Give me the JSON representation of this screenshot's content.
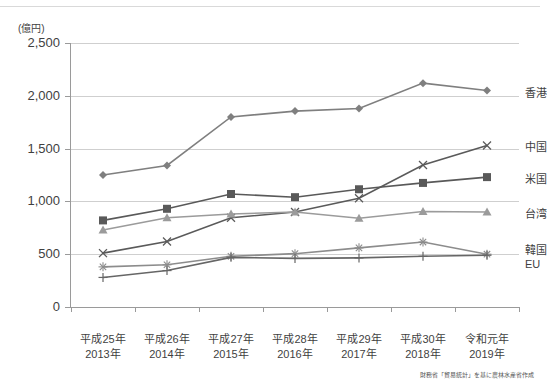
{
  "chart_data": {
    "type": "line",
    "title": "",
    "unit_label": "(億円)",
    "xlabel": "",
    "ylabel": "",
    "ylim": [
      0,
      2500
    ],
    "yticks": [
      "0",
      "500",
      "1,000",
      "1,500",
      "2,000",
      "2,500"
    ],
    "ytick_values": [
      0,
      500,
      1000,
      1500,
      2000,
      2500
    ],
    "grid": true,
    "legend_position": "right",
    "categories": [
      "2013",
      "2014",
      "2015",
      "2016",
      "2017",
      "2018",
      "2019"
    ],
    "category_labels": [
      {
        "era": "平成25年",
        "year": "2013年"
      },
      {
        "era": "平成26年",
        "year": "2014年"
      },
      {
        "era": "平成27年",
        "year": "2015年"
      },
      {
        "era": "平成28年",
        "year": "2016年"
      },
      {
        "era": "平成29年",
        "year": "2017年"
      },
      {
        "era": "平成30年",
        "year": "2018年"
      },
      {
        "era": "令和元年",
        "year": "2019年"
      }
    ],
    "series": [
      {
        "name": "香港",
        "marker": "diamond",
        "color": "#7f7f7f",
        "values": [
          1250,
          1340,
          1800,
          1855,
          1880,
          2120,
          2050
        ]
      },
      {
        "name": "中国",
        "marker": "x",
        "color": "#5a5a5a",
        "values": [
          510,
          620,
          845,
          900,
          1030,
          1345,
          1530
        ]
      },
      {
        "name": "米国",
        "marker": "square",
        "color": "#595959",
        "values": [
          820,
          930,
          1070,
          1040,
          1115,
          1175,
          1230
        ]
      },
      {
        "name": "台湾",
        "marker": "triangle",
        "color": "#9b9b9b",
        "values": [
          730,
          845,
          880,
          900,
          840,
          905,
          900
        ]
      },
      {
        "name": "韓国",
        "marker": "star",
        "color": "#8c8c8c",
        "values": [
          380,
          400,
          480,
          505,
          560,
          615,
          500
        ]
      },
      {
        "name": "EU",
        "marker": "plus",
        "color": "#666666",
        "values": [
          280,
          345,
          470,
          460,
          465,
          480,
          490
        ]
      }
    ],
    "source_note": "財務省「貿易統計」を基に農林水産省作成"
  },
  "legend": {
    "items": [
      {
        "label": "香港"
      },
      {
        "label": "中国"
      },
      {
        "label": "米国"
      },
      {
        "label": "台湾"
      },
      {
        "label": "韓国"
      },
      {
        "label": "EU"
      }
    ]
  }
}
